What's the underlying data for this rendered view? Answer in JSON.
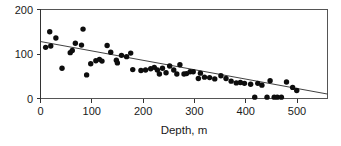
{
  "figure": {
    "background_color": "#ffffff",
    "foreground_color": "#1a1a1a"
  },
  "chart_data": {
    "type": "scatter",
    "title": "",
    "subtitle": "",
    "xlabel": "Depth, m",
    "ylabel": "",
    "xlim": [
      0,
      560
    ],
    "ylim": [
      0,
      200
    ],
    "xticks": [
      0,
      100,
      200,
      300,
      400,
      500
    ],
    "xtick_labels": [
      "0",
      "100",
      "200",
      "300",
      "400",
      "500"
    ],
    "yticks": [
      0,
      100,
      200
    ],
    "ytick_labels": [
      "0",
      "100",
      "200"
    ],
    "grid": false,
    "legend": null,
    "legend_position": "none",
    "marker": "filled-circle",
    "marker_color": "#0d0d0d",
    "marker_size": 3.6,
    "annotations": [],
    "series": [
      {
        "name": "observations",
        "type": "scatter",
        "points": [
          [
            10,
            115
          ],
          [
            18,
            150
          ],
          [
            20,
            118
          ],
          [
            30,
            136
          ],
          [
            42,
            68
          ],
          [
            58,
            103
          ],
          [
            62,
            108
          ],
          [
            68,
            124
          ],
          [
            80,
            120
          ],
          [
            83,
            156
          ],
          [
            90,
            53
          ],
          [
            98,
            78
          ],
          [
            108,
            85
          ],
          [
            115,
            88
          ],
          [
            120,
            84
          ],
          [
            130,
            119
          ],
          [
            137,
            104
          ],
          [
            148,
            86
          ],
          [
            150,
            80
          ],
          [
            158,
            97
          ],
          [
            168,
            94
          ],
          [
            176,
            102
          ],
          [
            180,
            65
          ],
          [
            196,
            63
          ],
          [
            205,
            64
          ],
          [
            215,
            67
          ],
          [
            222,
            70
          ],
          [
            228,
            64
          ],
          [
            232,
            55
          ],
          [
            238,
            68
          ],
          [
            245,
            58
          ],
          [
            252,
            73
          ],
          [
            260,
            64
          ],
          [
            266,
            55
          ],
          [
            272,
            76
          ],
          [
            280,
            55
          ],
          [
            285,
            56
          ],
          [
            292,
            60
          ],
          [
            298,
            60
          ],
          [
            308,
            45
          ],
          [
            312,
            57
          ],
          [
            320,
            48
          ],
          [
            330,
            47
          ],
          [
            340,
            44
          ],
          [
            352,
            51
          ],
          [
            362,
            45
          ],
          [
            372,
            39
          ],
          [
            382,
            35
          ],
          [
            390,
            36
          ],
          [
            398,
            34
          ],
          [
            410,
            32
          ],
          [
            418,
            3
          ],
          [
            424,
            34
          ],
          [
            432,
            30
          ],
          [
            442,
            3
          ],
          [
            448,
            40
          ],
          [
            456,
            3
          ],
          [
            462,
            3
          ],
          [
            470,
            3
          ],
          [
            480,
            37
          ],
          [
            492,
            25
          ],
          [
            500,
            18
          ]
        ]
      },
      {
        "name": "regression-line",
        "type": "line",
        "points": [
          [
            0,
            128
          ],
          [
            560,
            10
          ]
        ]
      }
    ]
  }
}
